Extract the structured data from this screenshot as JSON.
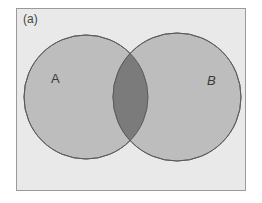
{
  "figure": {
    "panel_label": "(a)",
    "type": "venn-diagram",
    "sets": [
      {
        "label": "A",
        "fill": "#bdbdbd",
        "stroke": "#6a6a6a"
      },
      {
        "label": "B",
        "fill": "#bdbdbd",
        "stroke": "#6a6a6a"
      }
    ],
    "intersection": {
      "fill": "#7b7b7b"
    },
    "background": "#e9e9e9"
  }
}
